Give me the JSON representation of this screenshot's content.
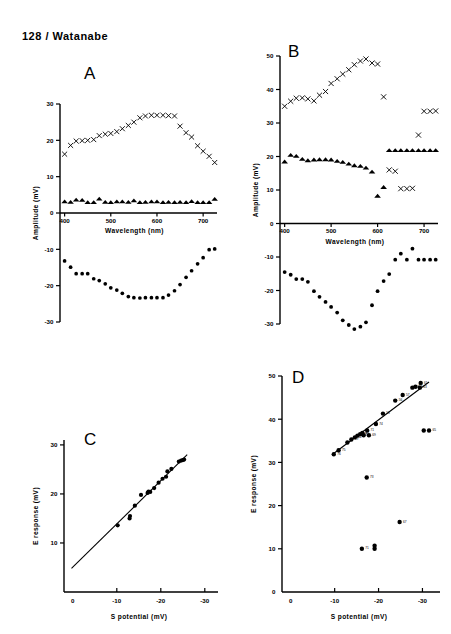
{
  "header": {
    "text": "128 / Watanabe"
  },
  "panels": {
    "A": {
      "letter": "A",
      "xlabel": "Wavelength   (nm)",
      "ylabel": "Amplitude  (mV)",
      "xticks": [
        "400",
        "500",
        "600",
        "700"
      ],
      "yticks": [
        "30",
        "20",
        "10",
        "0",
        "-10",
        "-20",
        "-30"
      ]
    },
    "B": {
      "letter": "B",
      "xlabel": "Wavelength   (nm)",
      "ylabel": "Amplitude  (mV)",
      "xticks": [
        "400",
        "500",
        "600",
        "700"
      ],
      "yticks": [
        "50",
        "40",
        "30",
        "20",
        "10",
        "0",
        "-10",
        "-20",
        "-30"
      ]
    },
    "C": {
      "letter": "C",
      "xlabel": "S  potential   (mV)",
      "ylabel": "E  response   (mV)",
      "xticks": [
        "0",
        "-10",
        "-20",
        "-30"
      ],
      "yticks": [
        "30",
        "20",
        "10"
      ]
    },
    "D": {
      "letter": "D",
      "xlabel": "S  potential   (mV)",
      "ylabel": "E  response   (mV)",
      "xticks": [
        "0",
        "-10",
        "-20",
        "-30"
      ],
      "yticks": [
        "50",
        "40",
        "30",
        "20",
        "10",
        "0"
      ]
    }
  },
  "chart_data": [
    {
      "id": "A",
      "type": "scatter",
      "title": "A",
      "xlabel": "Wavelength (nm)",
      "ylabel": "Amplitude (mV)",
      "xlim": [
        390,
        730
      ],
      "ylim": [
        -30,
        30
      ],
      "xticks": [
        400,
        500,
        600,
        700
      ],
      "yticks": [
        -30,
        -20,
        -10,
        0,
        10,
        20,
        30
      ],
      "grid": false,
      "legend": "none",
      "series": [
        {
          "name": "cross",
          "marker": "x",
          "x": [
            400,
            413,
            425,
            438,
            450,
            463,
            475,
            488,
            500,
            513,
            525,
            538,
            550,
            563,
            575,
            588,
            600,
            613,
            625,
            638,
            650,
            663,
            675,
            688,
            700,
            713,
            725
          ],
          "y": [
            16.2,
            18.6,
            19.8,
            19.9,
            20.0,
            20.2,
            21.3,
            21.7,
            21.9,
            22.4,
            23.2,
            24.1,
            25.0,
            26.2,
            26.7,
            26.9,
            26.9,
            26.9,
            26.8,
            26.7,
            23.9,
            22.1,
            20.9,
            18.5,
            17.0,
            15.6,
            13.9
          ]
        },
        {
          "name": "triangle",
          "marker": "triangle",
          "x": [
            400,
            413,
            425,
            438,
            450,
            463,
            475,
            488,
            500,
            513,
            525,
            538,
            550,
            563,
            575,
            588,
            600,
            613,
            625,
            638,
            650,
            663,
            675,
            688,
            700,
            713,
            725
          ],
          "y": [
            3.1,
            3.0,
            3.6,
            3.5,
            2.9,
            2.9,
            3.9,
            3.0,
            2.9,
            3.1,
            3.1,
            3.0,
            3.4,
            2.9,
            3.0,
            3.1,
            3.1,
            2.9,
            3.0,
            2.9,
            3.0,
            2.9,
            3.2,
            2.9,
            2.9,
            2.9,
            3.8
          ]
        },
        {
          "name": "circle",
          "marker": "circle",
          "x": [
            400,
            413,
            425,
            438,
            450,
            463,
            475,
            488,
            500,
            513,
            525,
            538,
            550,
            563,
            575,
            588,
            600,
            613,
            625,
            638,
            650,
            663,
            675,
            688,
            700,
            713,
            725
          ],
          "y": [
            -13.2,
            -14.9,
            -16.7,
            -16.7,
            -16.7,
            -18.1,
            -18.6,
            -19.5,
            -20.6,
            -21.2,
            -22.1,
            -23.0,
            -23.3,
            -23.4,
            -23.3,
            -23.3,
            -23.3,
            -23.3,
            -22.6,
            -21.4,
            -19.7,
            -17.7,
            -15.9,
            -14.0,
            -12.3,
            -10.1,
            -9.9
          ]
        }
      ]
    },
    {
      "id": "B",
      "type": "scatter",
      "title": "B",
      "xlabel": "Wavelength (nm)",
      "ylabel": "Amplitude (mV)",
      "xlim": [
        390,
        730
      ],
      "ylim": [
        -30,
        50
      ],
      "xticks": [
        400,
        500,
        600,
        700
      ],
      "yticks": [
        -30,
        -20,
        -10,
        0,
        10,
        20,
        30,
        40,
        50
      ],
      "grid": false,
      "legend": "none",
      "series": [
        {
          "name": "cross",
          "marker": "x",
          "x": [
            400,
            413,
            425,
            438,
            450,
            463,
            475,
            488,
            500,
            513,
            525,
            538,
            550,
            563,
            575,
            588,
            600,
            613,
            625,
            638,
            650,
            663,
            675,
            688,
            700,
            713,
            725
          ],
          "y": [
            35.0,
            36.5,
            37.4,
            37.5,
            37.2,
            36.6,
            38.3,
            39.4,
            41.8,
            43.2,
            44.6,
            45.9,
            47.4,
            48.5,
            49.1,
            47.9,
            47.6,
            37.8,
            16.0,
            15.6,
            10.4,
            10.4,
            10.5,
            26.4,
            33.5,
            33.5,
            33.6
          ]
        },
        {
          "name": "triangle",
          "marker": "triangle",
          "x": [
            400,
            413,
            425,
            438,
            450,
            463,
            475,
            488,
            500,
            513,
            525,
            538,
            550,
            563,
            575,
            588,
            600,
            613,
            625,
            638,
            650,
            663,
            675,
            688,
            700,
            713,
            725
          ],
          "y": [
            18.4,
            20.4,
            20.1,
            19.2,
            18.8,
            19.0,
            19.1,
            19.1,
            19.0,
            18.6,
            18.3,
            17.8,
            17.3,
            17.1,
            16.6,
            15.4,
            8.2,
            10.8,
            21.8,
            21.8,
            21.8,
            21.8,
            21.8,
            21.8,
            21.8,
            21.8,
            21.8
          ]
        },
        {
          "name": "circle",
          "marker": "circle",
          "x": [
            400,
            413,
            425,
            438,
            450,
            463,
            475,
            488,
            500,
            513,
            525,
            538,
            550,
            563,
            575,
            588,
            600,
            613,
            625,
            638,
            650,
            663,
            675,
            688,
            700,
            713,
            725
          ],
          "y": [
            -14.5,
            -15.3,
            -16.6,
            -16.6,
            -17.4,
            -20.2,
            -21.9,
            -23.4,
            -24.9,
            -26.6,
            -28.9,
            -30.3,
            -31.5,
            -30.8,
            -29.5,
            -24.4,
            -20.2,
            -17.2,
            -15.1,
            -10.8,
            -9.0,
            -10.8,
            -7.5,
            -10.8,
            -10.8,
            -10.8,
            -10.8
          ]
        }
      ]
    },
    {
      "id": "C",
      "type": "scatter",
      "title": "C",
      "xlabel": "S potential (mV)",
      "ylabel": "E response (mV)",
      "xlim": [
        2,
        -33
      ],
      "ylim": [
        0,
        31
      ],
      "xticks": [
        0,
        -10,
        -20,
        -30
      ],
      "yticks": [
        10,
        20,
        30
      ],
      "grid": false,
      "legend": "none",
      "fit_line": {
        "x": [
          0.3,
          -26.0
        ],
        "y": [
          4.8,
          28.0
        ]
      },
      "series": [
        {
          "name": "data",
          "marker": "circle",
          "x": [
            -10.2,
            -12.9,
            -13.0,
            -14.1,
            -15.5,
            -17.0,
            -17.2,
            -17.6,
            -18.5,
            -19.5,
            -20.4,
            -21.2,
            -21.5,
            -22.4,
            -24.1,
            -24.6,
            -25.0,
            -25.3
          ],
          "y": [
            13.6,
            15.0,
            15.5,
            17.6,
            19.8,
            20.2,
            20.5,
            20.4,
            21.2,
            22.3,
            23.1,
            23.5,
            24.6,
            25.1,
            26.6,
            26.8,
            26.9,
            27.0
          ]
        }
      ]
    },
    {
      "id": "D",
      "type": "scatter",
      "title": "D",
      "xlabel": "S potential (mV)",
      "ylabel": "E response (mV)",
      "xlim": [
        2,
        -34
      ],
      "ylim": [
        0,
        50
      ],
      "xticks": [
        0,
        -10,
        -20,
        -30
      ],
      "yticks": [
        0,
        10,
        20,
        30,
        40,
        50
      ],
      "grid": false,
      "legend": "none",
      "fit_line": {
        "x": [
          -9.7,
          -31.5
        ],
        "y": [
          32.0,
          48.6
        ]
      },
      "series": [
        {
          "name": "labeled-points",
          "marker": "circle",
          "points": [
            {
              "x": -9.8,
              "y": 31.9,
              "label": "76"
            },
            {
              "x": -10.9,
              "y": 32.8,
              "label": "75"
            },
            {
              "x": -12.9,
              "y": 34.6,
              "label": ""
            },
            {
              "x": -13.8,
              "y": 35.3,
              "label": "49"
            },
            {
              "x": -14.6,
              "y": 35.8,
              "label": "52"
            },
            {
              "x": -15.2,
              "y": 36.2,
              "label": "46"
            },
            {
              "x": -15.8,
              "y": 36.5,
              "label": "48"
            },
            {
              "x": -16.3,
              "y": 36.8,
              "label": "47"
            },
            {
              "x": -16.6,
              "y": 36.3,
              "label": ""
            },
            {
              "x": -17.4,
              "y": 37.4,
              "label": "71"
            },
            {
              "x": -17.8,
              "y": 36.3,
              "label": "69"
            },
            {
              "x": -19.4,
              "y": 38.9,
              "label": "74"
            },
            {
              "x": -21.0,
              "y": 41.3,
              "label": "53"
            },
            {
              "x": -23.8,
              "y": 44.3,
              "label": "56"
            },
            {
              "x": -25.5,
              "y": 45.6,
              "label": "57"
            },
            {
              "x": -27.7,
              "y": 47.3,
              "label": "59"
            },
            {
              "x": -28.4,
              "y": 47.5,
              "label": "58"
            },
            {
              "x": -29.6,
              "y": 48.4,
              "label": "61"
            },
            {
              "x": -29.4,
              "y": 47.3,
              "label": "63"
            },
            {
              "x": -30.3,
              "y": 37.4,
              "label": ""
            },
            {
              "x": -31.5,
              "y": 37.4,
              "label": "65"
            },
            {
              "x": -17.3,
              "y": 26.5,
              "label": "73"
            },
            {
              "x": -24.8,
              "y": 16.2,
              "label": "67"
            },
            {
              "x": -16.2,
              "y": 10.0,
              "label": "71"
            },
            {
              "x": -19.1,
              "y": 10.7,
              "label": ""
            },
            {
              "x": -19.1,
              "y": 10.0,
              "label": ""
            }
          ]
        }
      ]
    }
  ]
}
